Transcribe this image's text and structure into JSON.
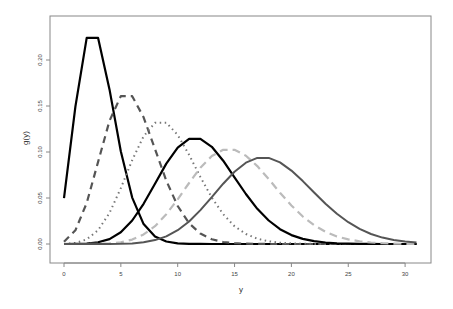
{
  "chart_data": {
    "type": "line",
    "title": "",
    "xlabel": "y",
    "ylabel": "g(y)",
    "xlim": [
      0,
      31
    ],
    "ylim": [
      0,
      0.224
    ],
    "grid": false,
    "legend": null,
    "x_ticks": [
      "0",
      "5",
      "10",
      "15",
      "20",
      "25",
      "30"
    ],
    "y_ticks": [
      "0.00",
      "0.05",
      "0.10",
      "0.15",
      "0.20"
    ],
    "x": [
      0,
      1,
      2,
      3,
      4,
      5,
      6,
      7,
      8,
      9,
      10,
      11,
      12,
      13,
      14,
      15,
      16,
      17,
      18,
      19,
      20,
      21,
      22,
      23,
      24,
      25,
      26,
      27,
      28,
      29,
      30,
      31
    ],
    "series": [
      {
        "name": "lambda=3",
        "color": "#000000",
        "dash": "",
        "width": 2.2,
        "values": [
          0.0498,
          0.1494,
          0.224,
          0.224,
          0.168,
          0.1008,
          0.0504,
          0.0216,
          0.0081,
          0.0027,
          0.0008,
          0.0002,
          0.0001,
          0,
          0,
          0,
          0,
          0,
          0,
          0,
          0,
          0,
          0,
          0,
          0,
          0,
          0,
          0,
          0,
          0,
          0,
          0
        ]
      },
      {
        "name": "lambda=6",
        "color": "#555555",
        "dash": "7,5",
        "width": 2.2,
        "values": [
          0.0025,
          0.0149,
          0.0446,
          0.0892,
          0.1339,
          0.1606,
          0.1606,
          0.1377,
          0.1033,
          0.0688,
          0.0413,
          0.0225,
          0.0113,
          0.0052,
          0.0022,
          0.0009,
          0.0003,
          0.0001,
          0,
          0,
          0,
          0,
          0,
          0,
          0,
          0,
          0,
          0,
          0,
          0,
          0,
          0
        ]
      },
      {
        "name": "lambda=9",
        "color": "#777777",
        "dash": "1.5,3.5",
        "width": 2,
        "values": [
          0.0001,
          0.0011,
          0.005,
          0.015,
          0.0337,
          0.0607,
          0.0911,
          0.1171,
          0.1318,
          0.1318,
          0.1186,
          0.097,
          0.0728,
          0.0504,
          0.0324,
          0.0194,
          0.0109,
          0.0058,
          0.0029,
          0.0014,
          0.0006,
          0.0003,
          0.0001,
          0,
          0,
          0,
          0,
          0,
          0,
          0,
          0,
          0
        ]
      },
      {
        "name": "lambda=12",
        "color": "#000000",
        "dash": "",
        "width": 2.2,
        "values": [
          0,
          0.0001,
          0.0004,
          0.0018,
          0.0053,
          0.0127,
          0.0255,
          0.0437,
          0.0655,
          0.0874,
          0.1048,
          0.1144,
          0.1144,
          0.1056,
          0.0905,
          0.0724,
          0.0543,
          0.0383,
          0.0255,
          0.0161,
          0.0097,
          0.0055,
          0.003,
          0.0016,
          0.0008,
          0.0004,
          0.0002,
          0.0001,
          0,
          0,
          0,
          0
        ]
      },
      {
        "name": "lambda=15",
        "color": "#bbbbbb",
        "dash": "8,5",
        "width": 2.2,
        "values": [
          0,
          0,
          0,
          0.0002,
          0.0006,
          0.0019,
          0.0048,
          0.0104,
          0.0194,
          0.0324,
          0.0486,
          0.0663,
          0.0829,
          0.0956,
          0.1024,
          0.1024,
          0.096,
          0.0847,
          0.0706,
          0.0557,
          0.0418,
          0.0299,
          0.0204,
          0.0133,
          0.0083,
          0.005,
          0.0029,
          0.0016,
          0.0009,
          0.0004,
          0.0002,
          0.0001
        ]
      },
      {
        "name": "lambda=18",
        "color": "#555555",
        "dash": "",
        "width": 2,
        "values": [
          0,
          0,
          0,
          0,
          0.0001,
          0.0002,
          0.0007,
          0.0018,
          0.0042,
          0.0083,
          0.015,
          0.0245,
          0.0368,
          0.0509,
          0.0655,
          0.0786,
          0.0884,
          0.0936,
          0.0936,
          0.0887,
          0.0798,
          0.0684,
          0.056,
          0.0438,
          0.0328,
          0.0237,
          0.0164,
          0.0109,
          0.007,
          0.0044,
          0.0026,
          0.0015
        ]
      }
    ]
  }
}
